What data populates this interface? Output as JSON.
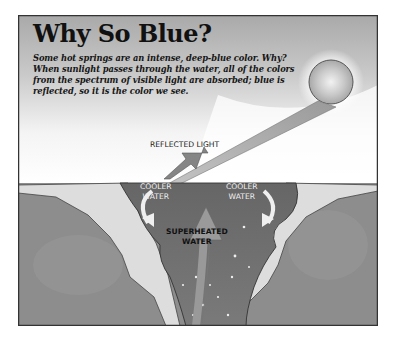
{
  "diagram": {
    "title": "Why So Blue?",
    "description": "Some hot springs are an intense, deep-blue color. Why? When sunlight passes through the water, all of the colors from the spectrum of visible light are absorbed; blue is reflected, so it is the color we see.",
    "labels": {
      "reflected_light": "REFLECTED LIGHT",
      "cooler_water_left_line1": "COOLER",
      "cooler_water_left_line2": "WATER",
      "cooler_water_right_line1": "COOLER",
      "cooler_water_right_line2": "WATER",
      "superheated_line1": "SUPERHEATED",
      "superheated_line2": "WATER"
    },
    "icons": [
      "sun-icon",
      "sunlight-beam-icon",
      "reflected-light-arrow-icon",
      "cooler-water-arrow-icon",
      "rising-water-arrow-icon"
    ],
    "colors": {
      "sky": "#b8b8b8",
      "sky_light": "#ededed",
      "water": "#6f6f6f",
      "rock": "#8e8e8e",
      "sinter": "#dcdcdc",
      "border": "#333333"
    }
  }
}
